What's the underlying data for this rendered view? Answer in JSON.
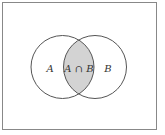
{
  "diagram": {
    "type": "venn",
    "sets": [
      {
        "label": "A"
      },
      {
        "label": "B"
      }
    ],
    "intersection": {
      "label": "A ∩ B",
      "fill": "#d3d3d3"
    },
    "colors": {
      "stroke": "#555555",
      "frame": "#888888",
      "background": "#ffffff"
    }
  }
}
